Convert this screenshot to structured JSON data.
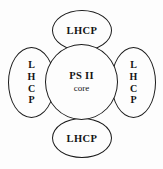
{
  "diagram": {
    "background_color": "#fdfdfd",
    "stroke_color": "#1a1a1a",
    "text_color": "#141414",
    "center": {
      "name": "ps2-core",
      "label_line1": "PS II",
      "label_line2": "core"
    },
    "satellites": [
      {
        "name": "lhcp-top",
        "position": "top",
        "orientation": "horizontal",
        "label": "LHCP"
      },
      {
        "name": "lhcp-right",
        "position": "right",
        "orientation": "vertical",
        "label": "LHCP",
        "letters": [
          "L",
          "H",
          "C",
          "P"
        ]
      },
      {
        "name": "lhcp-bottom",
        "position": "bottom",
        "orientation": "horizontal",
        "label": "LHCP"
      },
      {
        "name": "lhcp-left",
        "position": "left",
        "orientation": "vertical",
        "label": "LHCP",
        "letters": [
          "L",
          "H",
          "C",
          "P"
        ]
      }
    ]
  }
}
